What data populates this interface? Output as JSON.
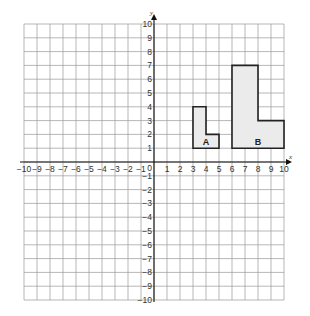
{
  "chart_data": {
    "type": "coordinate-grid",
    "xlim": [
      -10,
      10
    ],
    "ylim": [
      -10,
      10
    ],
    "xlabel": "x",
    "ylabel": "y",
    "grid": true,
    "x_ticks": [
      -10,
      -9,
      -8,
      -7,
      -6,
      -5,
      -4,
      -3,
      -2,
      -1,
      1,
      2,
      3,
      4,
      5,
      6,
      7,
      8,
      9,
      10
    ],
    "y_ticks": [
      -10,
      -9,
      -8,
      -7,
      -6,
      -5,
      -4,
      -3,
      -2,
      -1,
      1,
      2,
      3,
      4,
      5,
      6,
      7,
      8,
      9,
      10
    ],
    "origin_label": "0",
    "shapes": [
      {
        "name": "A",
        "label_at": [
          4,
          1.5
        ],
        "vertices": [
          [
            3,
            1
          ],
          [
            3,
            4
          ],
          [
            4,
            4
          ],
          [
            4,
            2
          ],
          [
            5,
            2
          ],
          [
            5,
            1
          ]
        ]
      },
      {
        "name": "B",
        "label_at": [
          8,
          1.5
        ],
        "vertices": [
          [
            6,
            1
          ],
          [
            6,
            7
          ],
          [
            8,
            7
          ],
          [
            8,
            3
          ],
          [
            10,
            3
          ],
          [
            10,
            1
          ]
        ]
      }
    ]
  },
  "colors": {
    "grid": "#9a9a9a",
    "axis": "#111111",
    "shape_fill": "#ebebeb",
    "shape_stroke": "#222222"
  }
}
